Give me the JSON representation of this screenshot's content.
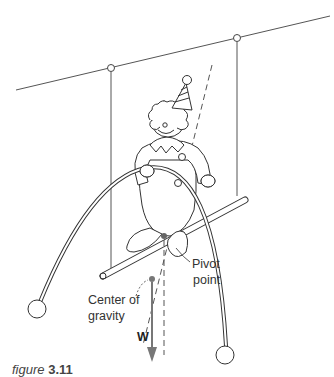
{
  "figure": {
    "labels": {
      "pivot_line1": "Pivot",
      "pivot_line2": "point",
      "cog_line1": "Center of",
      "cog_line2": "gravity",
      "weight": "W"
    },
    "caption_prefix": "figure",
    "caption_number": "3.11"
  }
}
